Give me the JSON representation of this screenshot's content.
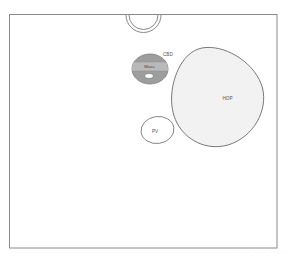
{
  "diagram": {
    "title": "",
    "colors": {
      "background": "#ffffff",
      "frame": "#8a8a8a",
      "outline": "#6f6f6f",
      "cbd_fill": "#9a9a9a",
      "cbd_band": "#bdbdbd",
      "hop_fill": "#f1f1f1",
      "pv_fill": "#ffffff",
      "label": "#555555"
    },
    "labels": {
      "cbd": "CBD",
      "mass": "Mass",
      "hop": "HOP",
      "pv": "PV"
    },
    "structures": [
      {
        "id": "top-vessel",
        "shape": "double-ring",
        "label": ""
      },
      {
        "id": "cbd",
        "shape": "ellipse",
        "label": "CBD",
        "filled": true
      },
      {
        "id": "mass",
        "shape": "band-in-ellipse",
        "label": "Mass"
      },
      {
        "id": "lumen",
        "shape": "small-ellipse",
        "label": ""
      },
      {
        "id": "hop",
        "shape": "blob",
        "label": "HOP",
        "texture": "stippled"
      },
      {
        "id": "pv",
        "shape": "ellipse",
        "label": "PV"
      }
    ]
  },
  "caption": {
    "text": ". . . . .  . . . . .  . . .   . . , . ."
  }
}
